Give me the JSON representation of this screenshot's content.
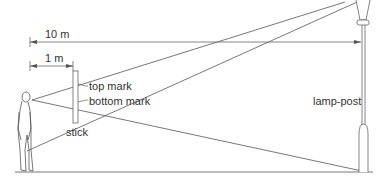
{
  "diagram": {
    "labels": {
      "distance_long": "10 m",
      "distance_short": "1 m",
      "top_mark": "top mark",
      "bottom_mark": "bottom mark",
      "stick": "stick",
      "lamp_post": "lamp-post"
    },
    "colors": {
      "line": "#555555",
      "text": "#333333",
      "background": "#ffffff"
    }
  }
}
